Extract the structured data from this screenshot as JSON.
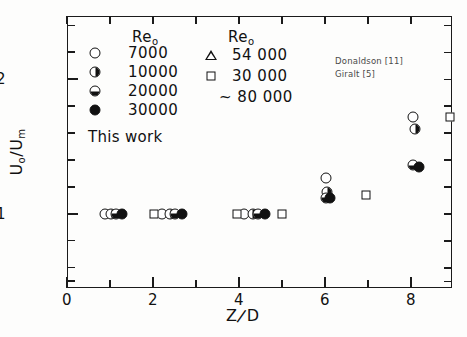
{
  "chart_data": {
    "type": "scatter",
    "title": "",
    "xlabel": "Z/D",
    "ylabel": "U₀/Uₘ",
    "xlim": [
      0,
      8.95
    ],
    "ylim": [
      0.45,
      2.47
    ],
    "xticks": [
      0,
      1,
      2,
      3,
      4,
      5,
      6,
      7,
      8
    ],
    "xticklabels": [
      "0",
      "",
      "2",
      "",
      "4",
      "",
      "6",
      "",
      "8"
    ],
    "yticks": [
      0.5,
      0.6,
      0.8,
      1.0,
      1.2,
      1.4,
      1.6,
      1.8,
      2.0,
      2.2,
      2.4
    ],
    "yticklabels": [
      "",
      "",
      "",
      "1",
      "",
      "",
      "",
      "",
      "2",
      "",
      ""
    ],
    "y_major": [
      1,
      2
    ],
    "grid": false,
    "legend_position": "upper-left",
    "series": [
      {
        "name": "7000",
        "marker": "circle-open",
        "source": "This work",
        "points": [
          {
            "x": 0.88,
            "y": 1.0
          },
          {
            "x": 2.2,
            "y": 1.0
          },
          {
            "x": 4.12,
            "y": 1.0
          },
          {
            "x": 6.02,
            "y": 1.27
          },
          {
            "x": 8.05,
            "y": 1.72
          }
        ]
      },
      {
        "name": "10000",
        "marker": "circle-half-right",
        "source": "This work",
        "points": [
          {
            "x": 1.03,
            "y": 1.0
          },
          {
            "x": 2.4,
            "y": 1.0
          },
          {
            "x": 4.32,
            "y": 1.0
          },
          {
            "x": 6.05,
            "y": 1.16
          },
          {
            "x": 8.1,
            "y": 1.63
          }
        ]
      },
      {
        "name": "20000",
        "marker": "circle-half-bottom",
        "source": "This work",
        "points": [
          {
            "x": 1.15,
            "y": 1.0
          },
          {
            "x": 2.52,
            "y": 1.0
          },
          {
            "x": 4.45,
            "y": 1.0
          },
          {
            "x": 6.02,
            "y": 1.12
          },
          {
            "x": 8.05,
            "y": 1.36
          }
        ]
      },
      {
        "name": "30000",
        "marker": "circle-filled",
        "source": "This work",
        "points": [
          {
            "x": 1.28,
            "y": 1.0
          },
          {
            "x": 2.68,
            "y": 1.0
          },
          {
            "x": 4.6,
            "y": 1.0
          },
          {
            "x": 6.12,
            "y": 1.12
          },
          {
            "x": 8.18,
            "y": 1.35
          }
        ]
      },
      {
        "name": "54 000",
        "marker": "triangle-open",
        "source": "Donaldson [11]",
        "points": []
      },
      {
        "name": "30 000",
        "marker": "square-open",
        "source": "Giralt [5]",
        "points": [
          {
            "x": 2.02,
            "y": 1.0
          },
          {
            "x": 3.95,
            "y": 1.0
          },
          {
            "x": 5.0,
            "y": 1.0
          },
          {
            "x": 6.95,
            "y": 1.14
          },
          {
            "x": 8.9,
            "y": 1.72
          }
        ]
      }
    ]
  },
  "legend": {
    "left_header": "Re",
    "left_header_sub": "o",
    "right_header": "Re",
    "right_header_sub": "o",
    "left_entries": [
      {
        "label": "7000",
        "marker": "circle-open"
      },
      {
        "label": "10000",
        "marker": "circle-half-right"
      },
      {
        "label": "20000",
        "marker": "circle-half-bottom"
      },
      {
        "label": "30000",
        "marker": "circle-filled"
      }
    ],
    "left_footer": "This work",
    "right_entries": [
      {
        "label": "54 000",
        "marker": "triangle-open"
      },
      {
        "label": "30 000",
        "marker": "square-open"
      },
      {
        "label": "~ 80 000",
        "marker": "none"
      }
    ],
    "references": [
      "Donaldson [11]",
      "Giralt [5]"
    ]
  },
  "axis_titles": {
    "x_main": "Z",
    "x_slash": "/",
    "x_denom": "D",
    "y_main": "U",
    "y_sub1": "o",
    "y_slash": "/U",
    "y_sub2": "m"
  },
  "colors": {
    "ink": "#111111",
    "background": "#fdfdfc",
    "reference_text": "#4a4a4a"
  }
}
